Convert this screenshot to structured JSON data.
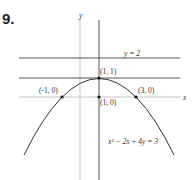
{
  "problem_number": "9.",
  "axes": {
    "x_label": "x",
    "y_label": "y"
  },
  "lines": {
    "horizontal_top": "y = 2"
  },
  "points": [
    {
      "label": "(1, 1)"
    },
    {
      "label": "(-1, 0)"
    },
    {
      "label": "(1, 0)"
    },
    {
      "label": "(3, 0)"
    }
  ],
  "equation": "x² − 2x + 4y = 3",
  "colors": {
    "curve": "#333333",
    "axis": "#b0b0b0",
    "line": "#444444"
  }
}
